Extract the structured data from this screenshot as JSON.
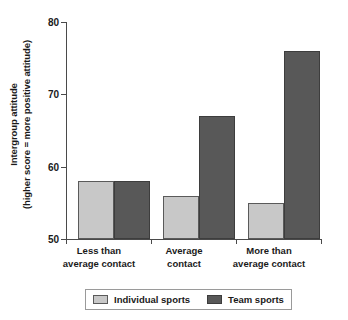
{
  "chart_data": {
    "type": "bar",
    "title": "",
    "xlabel": "",
    "ylabel_line1": "Intergroup attitude",
    "ylabel_line2": "(higher score = more positive attitude)",
    "categories": [
      {
        "line1": "Less than",
        "line2": "average contact"
      },
      {
        "line1": "Average",
        "line2": "contact"
      },
      {
        "line1": "More than",
        "line2": "average contact"
      }
    ],
    "series": [
      {
        "name": "Individual sports",
        "color": "#c8c8c8",
        "values": [
          58,
          56,
          55
        ]
      },
      {
        "name": "Team sports",
        "color": "#585858",
        "values": [
          58,
          67,
          76
        ]
      }
    ],
    "ylim": [
      50,
      80
    ],
    "yticks": [
      50,
      60,
      70,
      80
    ],
    "ytick_labels": [
      "50",
      "60",
      "70",
      "80"
    ],
    "grid": false,
    "legend_position": "bottom"
  },
  "legend": {
    "items": [
      {
        "label": "Individual sports",
        "swatch": "light"
      },
      {
        "label": "Team sports",
        "swatch": "dark"
      }
    ]
  }
}
